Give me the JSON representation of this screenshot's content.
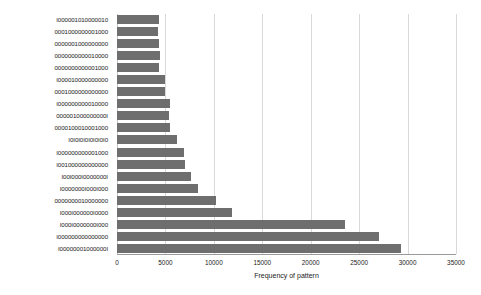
{
  "chart_data": {
    "type": "bar",
    "orientation": "horizontal",
    "title": "",
    "xlabel": "Frequency of pattern",
    "ylabel": "",
    "xlim": [
      0,
      35000
    ],
    "xticks": [
      0,
      5000,
      10000,
      15000,
      20000,
      25000,
      30000,
      35000
    ],
    "xtick_labels": [
      "0",
      "5000",
      "10000",
      "15000",
      "20000",
      "25000",
      "30000",
      "35000"
    ],
    "grid": true,
    "legend": null,
    "bar_color": "#6e6e6e",
    "grid_color": "#d9d9d9",
    "background": "#ffffff",
    "categories": [
      "I000001010000010",
      "0001000000001000",
      "0000001000000000",
      "0000000000010000",
      "0000000000001000",
      "I000010000000000",
      "0001000000000000",
      "I000000000010000",
      "000001000000000I",
      "0000100010001000",
      "I0I0I0I0I0I0I0I0",
      "I000000000001000",
      "I001000000000000",
      "I00I000I0000000I",
      "I0000000I000I000",
      "0000000010000000",
      "I000I000000I0000",
      "I000I0000000I000",
      "I000000000000000",
      "I00000001000000I"
    ],
    "values": [
      4300,
      4200,
      4300,
      4400,
      4300,
      5000,
      5000,
      5500,
      5400,
      5500,
      6200,
      6900,
      7000,
      7600,
      8400,
      10200,
      11900,
      23500,
      27100,
      29300
    ]
  }
}
